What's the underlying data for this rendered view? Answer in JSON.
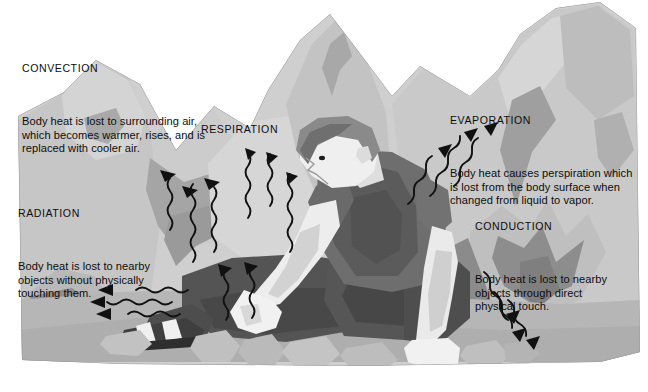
{
  "figure": {
    "background_color": "#ffffff"
  },
  "captions": {
    "convection": {
      "heading": "CONVECTION",
      "body": "Body heat is lost to surrounding air,\nwhich becomes warmer, rises, and is\nreplaced with cooler air."
    },
    "respiration": {
      "heading": "RESPIRATION",
      "body": ""
    },
    "evaporation": {
      "heading": "EVAPORATION",
      "body": "Body heat causes perspiration which\nis lost from the body surface when\nchanged from liquid to vapor."
    },
    "radiation": {
      "heading": "RADIATION",
      "body": "Body heat is lost to nearby\nobjects without physically\ntouching them."
    },
    "conduction": {
      "heading": "CONDUCTION",
      "body": "Body heat is lost to nearby\nobjects through direct\nphysical touch."
    }
  },
  "palette": {
    "paper": "#ffffff",
    "rock_lightest": "#dcdcdc",
    "rock_light": "#cfcfcf",
    "rock_mid": "#bdbdbd",
    "rock_mid2": "#b2b2b2",
    "rock_dark": "#8f8f8f",
    "rock_darker": "#7d7d7d",
    "ground": "#b6b6b6",
    "skin_light": "#efefef",
    "skin_shade": "#cfcfcf",
    "shirt": "#6e6e6e",
    "shirt_shadow": "#555555",
    "shorts": "#545454",
    "shorts_shadow": "#454545",
    "hair": "#8a8a8a",
    "hair_shadow": "#6f6f6f",
    "shoe_dark": "#3f3f3f",
    "arrow": "#111111",
    "text": "#0d0d0d"
  },
  "arrow_groups": [
    {
      "name": "convection-arrows",
      "mechanism": "convection",
      "direction": "up-left",
      "count": 3,
      "style": "wavy-shaft-with-solid-head"
    },
    {
      "name": "respiration-arrows",
      "mechanism": "respiration",
      "direction": "up",
      "count": 5,
      "style": "wavy-shaft-with-solid-head"
    },
    {
      "name": "radiation-arrows",
      "mechanism": "radiation",
      "direction": "left",
      "count": 3,
      "style": "wavy-shaft-with-solid-head"
    },
    {
      "name": "evaporation-arrows",
      "mechanism": "evaporation",
      "direction": "up-right",
      "count": 3,
      "style": "wavy-shaft-with-solid-head"
    },
    {
      "name": "conduction-arrows",
      "mechanism": "conduction",
      "direction": "down-right",
      "count": 3,
      "style": "wavy-shaft-with-solid-head"
    }
  ]
}
